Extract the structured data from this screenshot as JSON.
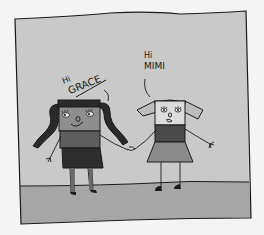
{
  "illustration": {
    "description": "Hand-drawn cartoon of two girls holding hands greeting each other",
    "colors": {
      "page_bg": "#f4f4f4",
      "sky": "#c9c9c9",
      "ground": "#a6a6a6",
      "ink": "#1a1a1a",
      "grace_face": "#8e8e8e",
      "grace_shirt": "#5e5e5e",
      "grace_skirt": "#2e2e2e",
      "grace_hair": "#2a2a2a",
      "mimi_face": "#dcdcdc",
      "mimi_shirt": "#4a4a4a",
      "mimi_skirt": "#8a8a8a",
      "mimi_hair": "#bdbdbd"
    },
    "speech": {
      "grace_line1": "Hi",
      "grace_line2": "GRACE",
      "mimi_line1": "Hi",
      "mimi_line2": "MIMI"
    },
    "characters": [
      {
        "name": "Mimi",
        "position": "left",
        "hair": "dark pigtails"
      },
      {
        "name": "Grace",
        "position": "right",
        "hair": "light pigtails"
      }
    ]
  }
}
